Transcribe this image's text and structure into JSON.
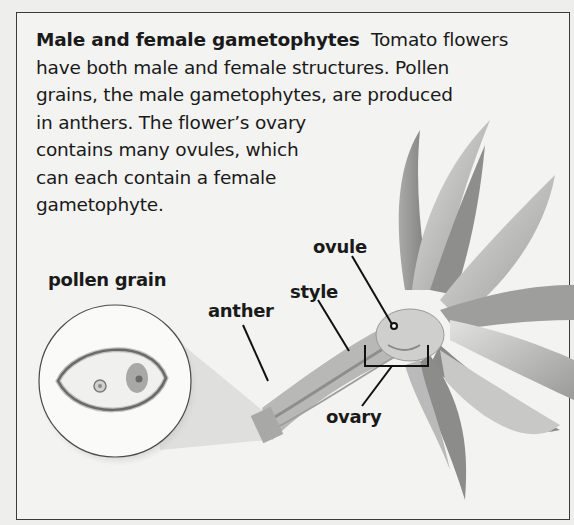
{
  "caption": {
    "title": "Male and female gametophytes",
    "lines": [
      "Tomato flowers",
      "have both male and female structures. Pollen",
      "grains, the male gametophytes, are produced",
      "in anthers. The flower’s ovary",
      "contains many ovules, which",
      "can each contain a female",
      "gametophyte."
    ]
  },
  "labels": {
    "pollen_grain": "pollen grain",
    "anther": "anther",
    "style": "style",
    "ovule": "ovule",
    "ovary": "ovary"
  },
  "colors": {
    "background": "#f3f3f1",
    "border": "#3a3a3a",
    "text": "#1a1a1a",
    "petal_light": "#d4d4d2",
    "petal_dark": "#8a8a88"
  }
}
